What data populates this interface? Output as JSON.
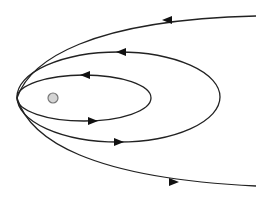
{
  "diagram": {
    "title": "",
    "colors": {
      "background": "#ffffff",
      "stroke": "#222222",
      "arrow": "#111111",
      "body_fill": "#d4d4d4",
      "body_stroke": "#777777"
    },
    "central_body": {
      "cx": 53,
      "cy": 98,
      "r": 5
    },
    "periapsis": {
      "x": 17,
      "y": 98
    },
    "orbits": [
      {
        "name": "inner-ellipse",
        "type": "ellipse",
        "cx": 84,
        "cy": 98,
        "rx": 67,
        "ry": 23,
        "arrows": [
          {
            "x": 85,
            "y": 75,
            "direction": "left"
          },
          {
            "x": 93,
            "y": 121,
            "direction": "right"
          }
        ]
      },
      {
        "name": "middle-ellipse",
        "type": "ellipse",
        "cx": 118.5,
        "cy": 97,
        "rx": 101.5,
        "ry": 45,
        "arrows": [
          {
            "x": 121,
            "y": 52,
            "direction": "left"
          },
          {
            "x": 119,
            "y": 142,
            "direction": "right"
          }
        ]
      },
      {
        "name": "upper-escape-trajectory",
        "type": "open",
        "path": "M 17 98 C 30 60, 90 20, 256 16",
        "arrows": [
          {
            "x": 167,
            "y": 20,
            "direction": "left"
          }
        ]
      },
      {
        "name": "lower-escape-trajectory",
        "type": "open",
        "path": "M 17 98 C 30 140, 90 178, 256 186",
        "arrows": [
          {
            "x": 174,
            "y": 182,
            "direction": "right"
          }
        ]
      }
    ]
  }
}
